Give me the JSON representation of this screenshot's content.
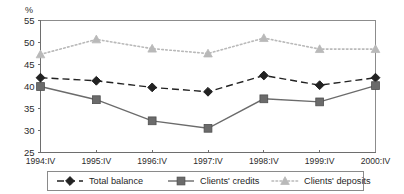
{
  "chart_data": {
    "type": "line",
    "title": "",
    "subtitle": "",
    "unit_label": "%",
    "xlabel": "",
    "ylabel": "",
    "categories": [
      "1994:IV",
      "1995:IV",
      "1996:IV",
      "1997:IV",
      "1998:IV",
      "1999:IV",
      "2000:IV"
    ],
    "ylim": [
      25,
      55
    ],
    "yticks": [
      25,
      30,
      35,
      40,
      45,
      50,
      55
    ],
    "ytick_labels": [
      "25",
      "30",
      "35",
      "40",
      "45",
      "50",
      "55"
    ],
    "grid": false,
    "legend_position": "bottom",
    "series": [
      {
        "name": "Total balance",
        "values": [
          42.0,
          41.3,
          39.8,
          38.8,
          42.5,
          40.3,
          42.0
        ],
        "color": "#222222",
        "marker": "diamond",
        "line_style": "dashed"
      },
      {
        "name": "Clients' credits",
        "values": [
          40.0,
          37.0,
          32.2,
          30.5,
          37.2,
          36.5,
          40.2
        ],
        "color": "#6b6b6b",
        "marker": "square",
        "line_style": "solid"
      },
      {
        "name": "Clients' deposits",
        "values": [
          47.3,
          50.7,
          48.6,
          47.5,
          51.0,
          48.5,
          48.5
        ],
        "color": "#b9b9b9",
        "marker": "triangle",
        "line_style": "dotted"
      }
    ]
  }
}
